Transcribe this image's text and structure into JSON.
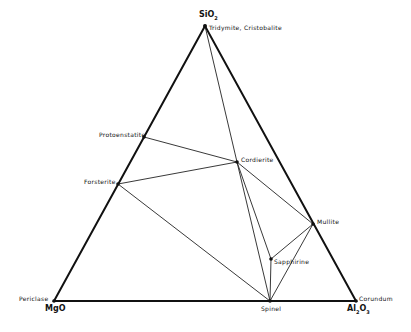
{
  "diagram": {
    "type": "ternary-phase-diagram",
    "components": {
      "top": "SiO2",
      "left": "MgO",
      "right": "Al2O3"
    },
    "vertex_phases": {
      "top": "Tridymite, Cristobalite",
      "left": "Periclase",
      "right": "Corundum"
    },
    "phases": [
      {
        "name": "Protoenstatite",
        "x": 144,
        "y": 137
      },
      {
        "name": "Forsterite",
        "x": 118,
        "y": 184
      },
      {
        "name": "Cordierite",
        "x": 237,
        "y": 162
      },
      {
        "name": "Mullite",
        "x": 313,
        "y": 224
      },
      {
        "name": "Sapphirine",
        "x": 271,
        "y": 259
      },
      {
        "name": "Spinel",
        "x": 270,
        "y": 301
      }
    ],
    "tie_lines": [
      [
        "SiO2",
        "Cordierite"
      ],
      [
        "Protoenstatite",
        "Cordierite"
      ],
      [
        "Forsterite",
        "Cordierite"
      ],
      [
        "Forsterite",
        "Spinel"
      ],
      [
        "Cordierite",
        "Spinel"
      ],
      [
        "Cordierite",
        "Sapphirine"
      ],
      [
        "Cordierite",
        "Mullite"
      ],
      [
        "Mullite",
        "Sapphirine"
      ],
      [
        "Mullite",
        "Spinel"
      ],
      [
        "Sapphirine",
        "Spinel"
      ]
    ]
  },
  "labels": {
    "sio2": "SiO",
    "sio2_sub": "2",
    "tridymite": "Tridymite, Cristobalite",
    "protoenstatite": "Protoenstatite",
    "forsterite": "Forsterite",
    "cordierite": "Cordierite",
    "mullite": "Mullite",
    "sapphirine": "Sapphirine",
    "periclase": "Periclase",
    "mgo": "MgO",
    "spinel": "Spinel",
    "corundum": "Corundum",
    "al2o3_a": "Al",
    "al2o3_sub1": "2",
    "al2o3_b": "O",
    "al2o3_sub2": "3"
  }
}
